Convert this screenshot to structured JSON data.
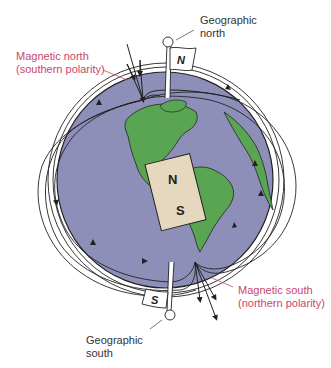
{
  "labels": {
    "magnetic_north": {
      "line1": "Magnetic north",
      "line2": "(southern polarity)"
    },
    "geographic_north": {
      "line1": "Geographic",
      "line2": "north"
    },
    "magnetic_south": {
      "line1": "Magnetic south",
      "line2": "(northern polarity)"
    },
    "geographic_south": {
      "line1": "Geographic",
      "line2": "south"
    }
  },
  "flags": {
    "north": "N",
    "south": "S"
  },
  "bar_magnet": {
    "north": "N",
    "south": "S"
  },
  "colors": {
    "ocean": "#8d8fb9",
    "land": "#5aa552",
    "magnet": "#e6d7bf",
    "magnetic_label": "#c8476a",
    "geographic_label": "#333333",
    "field_line": "#222222"
  }
}
